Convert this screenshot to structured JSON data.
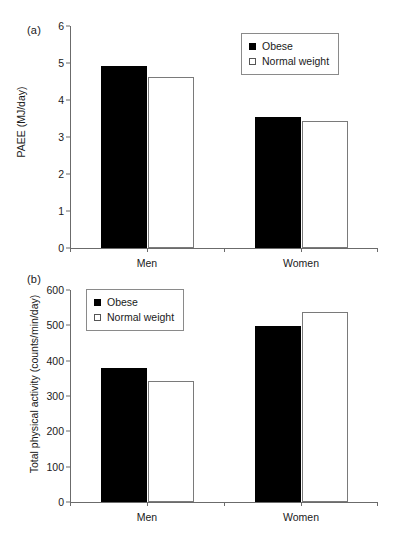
{
  "figure": {
    "panels": [
      {
        "id": "a",
        "label": "(a)",
        "ylabel": "PAEE (MJ/day)",
        "xlabel": "",
        "categories": [
          "Men",
          "Women"
        ],
        "yticks": [
          "0",
          "1",
          "2",
          "3",
          "4",
          "5",
          "6"
        ],
        "legend": [
          {
            "key": "obese",
            "label": "Obese"
          },
          {
            "key": "normal",
            "label": "Normal weight"
          }
        ]
      },
      {
        "id": "b",
        "label": "(b)",
        "ylabel": "Total physical activity (counts/min/day)",
        "xlabel": "",
        "categories": [
          "Men",
          "Women"
        ],
        "yticks": [
          "0",
          "100",
          "200",
          "300",
          "400",
          "500",
          "600"
        ],
        "legend": [
          {
            "key": "obese",
            "label": "Obese"
          },
          {
            "key": "normal",
            "label": "Normal weight"
          }
        ]
      }
    ]
  },
  "colors": {
    "obese_fill": "#000000",
    "normal_fill": "#ffffff",
    "normal_stroke": "#7a7a7a",
    "axis": "#6b6b6b",
    "text": "#1a1a1a"
  },
  "chart_data": [
    {
      "type": "bar",
      "panel": "a",
      "title": "",
      "xlabel": "",
      "ylabel": "PAEE (MJ/day)",
      "categories": [
        "Men",
        "Women"
      ],
      "ylim": [
        0,
        6
      ],
      "ytick_values": [
        0,
        1,
        2,
        3,
        4,
        5,
        6
      ],
      "grid": false,
      "legend_position": "top-right",
      "series": [
        {
          "name": "Obese",
          "values": [
            4.92,
            3.53
          ]
        },
        {
          "name": "Normal weight",
          "values": [
            4.62,
            3.43
          ]
        }
      ]
    },
    {
      "type": "bar",
      "panel": "b",
      "title": "",
      "xlabel": "",
      "ylabel": "Total physical activity (counts/min/day)",
      "categories": [
        "Men",
        "Women"
      ],
      "ylim": [
        0,
        600
      ],
      "ytick_values": [
        0,
        100,
        200,
        300,
        400,
        500,
        600
      ],
      "grid": false,
      "legend_position": "top-left",
      "series": [
        {
          "name": "Obese",
          "values": [
            378,
            498
          ]
        },
        {
          "name": "Normal weight",
          "values": [
            342,
            537
          ]
        }
      ]
    }
  ]
}
